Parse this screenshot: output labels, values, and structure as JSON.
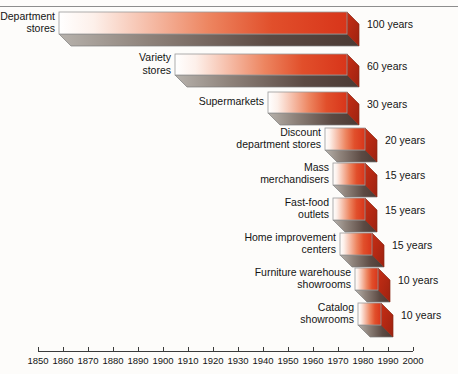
{
  "chart_data": {
    "type": "bar",
    "title": "",
    "subtitle": "",
    "xlabel": "",
    "ylabel": "",
    "orientation": "horizontal",
    "grid": false,
    "legend": false,
    "xlim": [
      1850,
      2000
    ],
    "xticks": [
      1850,
      1860,
      1870,
      1880,
      1890,
      1900,
      1910,
      1920,
      1930,
      1940,
      1950,
      1960,
      1970,
      1980,
      1990,
      2000
    ],
    "xtick_labels": [
      "1850",
      "1860",
      "1870",
      "1880",
      "1890",
      "1900",
      "1910",
      "1920",
      "1930",
      "1940",
      "1950",
      "1960",
      "1970",
      "1980",
      "1990",
      "2000"
    ],
    "categories": [
      "Department stores",
      "Variety stores",
      "Supermarkets",
      "Discount department stores",
      "Mass merchandisers",
      "Fast-food outlets",
      "Home improvement centers",
      "Furniture warehouse showrooms",
      "Catalog showrooms"
    ],
    "values": [
      100,
      60,
      30,
      20,
      15,
      15,
      15,
      10,
      10
    ],
    "value_labels": [
      "100 years",
      "60 years",
      "30 years",
      "20 years",
      "15 years",
      "15 years",
      "15 years",
      "10 years",
      "10 years"
    ],
    "units": "years",
    "bar_start_years": [
      1860,
      1910,
      1940,
      1950,
      1955,
      1958,
      1960,
      1965,
      1968
    ],
    "bar_end_years": [
      1960,
      1970,
      1970,
      1970,
      1970,
      1973,
      1975,
      1975,
      1978
    ],
    "colors": {
      "bar_gradient_light": "#fdfdfd",
      "bar_gradient_mid": "#e8673f",
      "bar_gradient_dark": "#d8351a",
      "bar_side": "#b92612",
      "bar_bottom": "#6b5a54",
      "axis": "#3a3a3a",
      "text": "#141414",
      "background": "#fdfcfa"
    }
  },
  "bars": [
    {
      "label": "Department\nstores",
      "value_label": "100 years",
      "x": 59,
      "y": 12,
      "w": 288,
      "h": 22
    },
    {
      "label": "Variety\nstores",
      "value_label": "60 years",
      "x": 175,
      "y": 54,
      "w": 172,
      "h": 21
    },
    {
      "label": "Supermarkets",
      "value_label": "30 years",
      "x": 268,
      "y": 92,
      "w": 79,
      "h": 21
    },
    {
      "label": "Discount\ndepartment stores",
      "value_label": "20 years",
      "x": 325,
      "y": 128,
      "w": 40,
      "h": 22
    },
    {
      "label": "Mass\nmerchandisers",
      "value_label": "15 years",
      "x": 333,
      "y": 163,
      "w": 32,
      "h": 22
    },
    {
      "label": "Fast-food\noutlets",
      "value_label": "15 years",
      "x": 333,
      "y": 198,
      "w": 32,
      "h": 22
    },
    {
      "label": "Home improvement\ncenters",
      "value_label": "15 years",
      "x": 340,
      "y": 233,
      "w": 32,
      "h": 22
    },
    {
      "label": "Furniture warehouse\nshowrooms",
      "value_label": "10 years",
      "x": 355,
      "y": 268,
      "w": 23,
      "h": 22
    },
    {
      "label": "Catalog\nshowrooms",
      "value_label": "10 years",
      "x": 358,
      "y": 303,
      "w": 23,
      "h": 22
    }
  ],
  "axis": {
    "ticks": [
      {
        "label": "1850",
        "x": 38
      },
      {
        "label": "1860",
        "x": 63
      },
      {
        "label": "1870",
        "x": 88
      },
      {
        "label": "1880",
        "x": 113
      },
      {
        "label": "1890",
        "x": 138
      },
      {
        "label": "1900",
        "x": 163
      },
      {
        "label": "1910",
        "x": 188
      },
      {
        "label": "1920",
        "x": 213
      },
      {
        "label": "1930",
        "x": 238
      },
      {
        "label": "1940",
        "x": 263
      },
      {
        "label": "1950",
        "x": 288
      },
      {
        "label": "1960",
        "x": 313
      },
      {
        "label": "1970",
        "x": 338
      },
      {
        "label": "1980",
        "x": 363
      },
      {
        "label": "1990",
        "x": 388
      },
      {
        "label": "2000",
        "x": 413
      }
    ],
    "y": 351
  }
}
